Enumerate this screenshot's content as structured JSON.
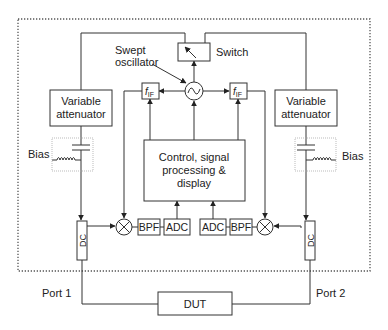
{
  "diagram": {
    "type": "block-diagram",
    "colors": {
      "line": "#333333",
      "dotted_border": "#555555",
      "bias_border": "#999999",
      "background": "#ffffff"
    },
    "labels": {
      "swept_oscillator_line1": "Swept",
      "swept_oscillator_line2": "oscillator",
      "switch": "Switch",
      "fif_left_main": "f",
      "fif_left_sub": "IF",
      "fif_right_main": "f",
      "fif_right_sub": "IF",
      "attenuator_left_line1": "Variable",
      "attenuator_left_line2": "attenuator",
      "attenuator_right_line1": "Variable",
      "attenuator_right_line2": "attenuator",
      "bias_left": "Bias",
      "bias_right": "Bias",
      "control_line1": "Control, signal",
      "control_line2": "processing &",
      "control_line3": "display",
      "bpf_left": "BPF",
      "adc_left": "ADC",
      "adc_right": "ADC",
      "bpf_right": "BPF",
      "dc_left": "DC",
      "dc_right": "DC",
      "port1": "Port 1",
      "port2": "Port 2",
      "dut": "DUT"
    }
  }
}
